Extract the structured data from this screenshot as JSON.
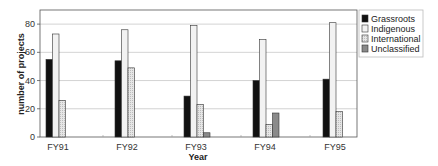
{
  "chart_data": {
    "type": "bar",
    "title": "",
    "xlabel": "Year",
    "ylabel": "number of projects",
    "ylim": [
      0,
      90
    ],
    "yticks": [
      0,
      20,
      40,
      60,
      80
    ],
    "grid": true,
    "legend_position": "right",
    "categories": [
      "FY91",
      "FY92",
      "FY93",
      "FY94",
      "FY95"
    ],
    "series": [
      {
        "name": "Grassroots",
        "color": "#111111",
        "values": [
          55,
          54,
          29,
          40,
          41
        ]
      },
      {
        "name": "Indigenous",
        "color": "#f2f2f2",
        "values": [
          73,
          76,
          79,
          69,
          81
        ]
      },
      {
        "name": "International",
        "color": "#dcdcdc",
        "values": [
          26,
          49,
          23,
          9,
          18
        ]
      },
      {
        "name": "Unclassified",
        "color": "#8a8a8a",
        "values": [
          0,
          0,
          3,
          17,
          0
        ]
      }
    ]
  }
}
